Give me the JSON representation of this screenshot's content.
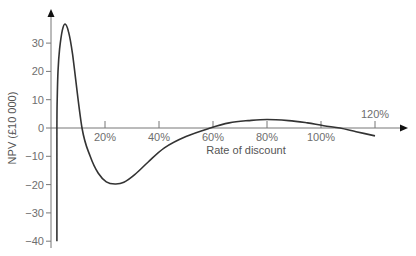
{
  "chart_data": {
    "type": "line",
    "title": "",
    "xlabel": "Rate of discount",
    "ylabel": "NPV (£10 000)",
    "x_unit": "%",
    "xlim": [
      0,
      124
    ],
    "ylim": [
      -40,
      40
    ],
    "x_ticks": [
      20,
      40,
      60,
      80,
      100,
      120
    ],
    "x_tick_labels": [
      "20%",
      "40%",
      "60%",
      "80%",
      "100%",
      "120%"
    ],
    "y_ticks": [
      30,
      20,
      10,
      0,
      -10,
      -20,
      -30,
      -40
    ],
    "y_tick_labels": [
      "30",
      "20",
      "10",
      "0",
      "−10",
      "−20",
      "−30",
      "−40"
    ],
    "grid": false,
    "legend": null,
    "series": [
      {
        "name": "NPV",
        "color": "#333333",
        "x": [
          2.2,
          2.2,
          2.3,
          2.6,
          3.2,
          4.2,
          5.2,
          6.5,
          8.0,
          11.5,
          14.5,
          17.5,
          20.5,
          23.7,
          27.0,
          31.0,
          36.0,
          42.0,
          50.0,
          59.0,
          66.0,
          73.0,
          80.0,
          88.0,
          95.0,
          101.0,
          107.0,
          113.0,
          120.0
        ],
        "values": [
          -40,
          0,
          10,
          20,
          28,
          34.5,
          36.7,
          34,
          26,
          0,
          -10,
          -16,
          -19,
          -19.8,
          -19.2,
          -16.5,
          -12,
          -7,
          -3,
          0,
          1.8,
          2.6,
          3.0,
          2.6,
          1.8,
          0.8,
          0,
          -1.3,
          -2.8
        ]
      }
    ],
    "annotations": []
  },
  "axes": {
    "y_label": "NPV (£10 000)",
    "x_label": "Rate of discount"
  }
}
